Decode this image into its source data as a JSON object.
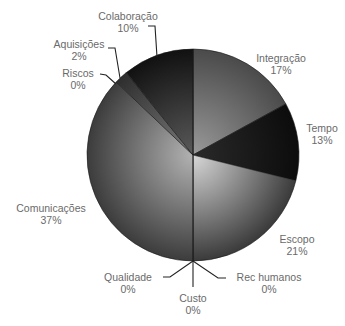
{
  "chart_data": {
    "type": "pie",
    "title": "",
    "start_angle_deg": 0,
    "direction": "clockwise",
    "categories": [
      "Integração",
      "Tempo",
      "Escopo",
      "Rec humanos",
      "Custo",
      "Qualidade",
      "Comunicações",
      "Riscos",
      "Aquisições",
      "Colaboração"
    ],
    "values": [
      17,
      13,
      21,
      0,
      0,
      0,
      37,
      0,
      2,
      10
    ],
    "value_labels": [
      "17%",
      "13%",
      "21%",
      "0%",
      "0%",
      "0%",
      "37%",
      "0%",
      "2%",
      "10%"
    ],
    "legend": "none (labels placed outside slices with leader lines)"
  },
  "slices": [
    {
      "name": "Integração",
      "pct": "17%",
      "angle_from": 0,
      "angle_to": 61.2,
      "color_in": "#9a9a9a",
      "color_out": "#4a4a4a",
      "label_x": 281,
      "label_y": 22
    },
    {
      "name": "Tempo",
      "pct": "13%",
      "angle_from": 61.2,
      "angle_to": 104,
      "color_in": "#2a2a2a",
      "color_out": "#0c0c0c",
      "label_x": 321,
      "label_y": 128
    },
    {
      "name": "Escopo",
      "pct": "21%",
      "angle_from": 104,
      "angle_to": 180,
      "color_in": "#d8d8d8",
      "color_out": "#3a3a3a",
      "label_x": 297,
      "label_y": 235
    },
    {
      "name": "Rec humanos",
      "pct": "0%",
      "angle_from": 180,
      "angle_to": 180,
      "label_x": 269,
      "label_y": 273
    },
    {
      "name": "Custo",
      "pct": "0%",
      "angle_from": 180,
      "angle_to": 180,
      "label_x": 193,
      "label_y": 298
    },
    {
      "name": "Qualidade",
      "pct": "0%",
      "angle_from": 180,
      "angle_to": 180,
      "label_x": 128,
      "label_y": 273
    },
    {
      "name": "Comunicações",
      "pct": "37%",
      "angle_from": 180,
      "angle_to": 313.5,
      "color_in": "#b2b2b2",
      "color_out": "#3c3c3c",
      "label_x": 51,
      "label_y": 205
    },
    {
      "name": "Riscos",
      "pct": "0%",
      "angle_from": 313.5,
      "angle_to": 313.5,
      "label_x": 78,
      "label_y": 73
    },
    {
      "name": "Aquisições",
      "pct": "2%",
      "angle_from": 313.5,
      "angle_to": 321,
      "color_in": "#7a7a7a",
      "color_out": "#2e2e2e",
      "label_x": 80,
      "label_y": 42
    },
    {
      "name": "Colaboração",
      "pct": "10%",
      "angle_from": 321,
      "angle_to": 360,
      "color_in": "#5a5a5a",
      "color_out": "#111111",
      "label_x": 128,
      "label_y": 7
    }
  ],
  "geometry": {
    "cx": 193,
    "cy": 155,
    "r": 106
  }
}
